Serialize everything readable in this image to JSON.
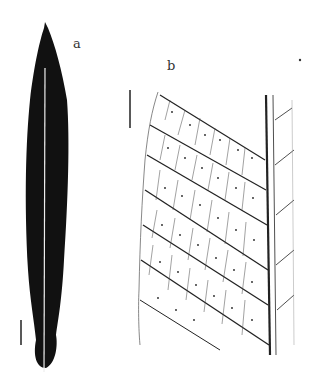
{
  "figure": {
    "panel_a": {
      "label": "a",
      "description": "Whole leaf silhouette, narrow lanceolate, dark with pale midrib",
      "scale_bar": true
    },
    "panel_b": {
      "label": "b",
      "description": "Venation detail showing secondary veins, areoles with dot-like glands, and midrib",
      "scale_bar": true
    }
  },
  "colors": {
    "leaf": "#111111",
    "midrib": "#eeeeee",
    "vein": "#222222",
    "background": "#ffffff"
  }
}
